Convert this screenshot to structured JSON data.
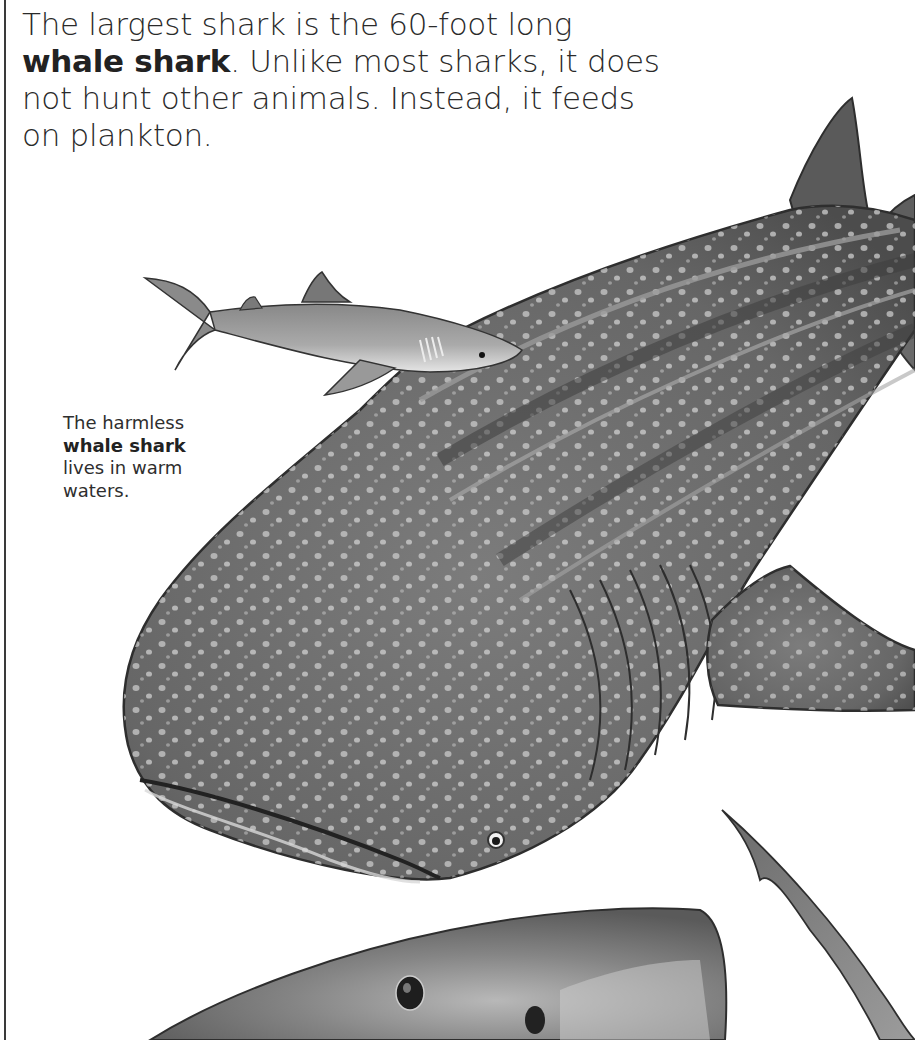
{
  "page": {
    "main_paragraph": {
      "line1": "The largest shark is the 60-foot long",
      "bold_term": "whale shark",
      "line2_rest": ". Unlike most sharks, it does",
      "line3": "not hunt other animals. Instead, it feeds",
      "line4": "on plankton."
    },
    "caption": {
      "line1": "The harmless",
      "bold_term": "whale shark",
      "line3": "lives in warm",
      "line4": "waters."
    },
    "illustration": {
      "subjects": [
        "small-shark",
        "whale-shark",
        "great-white-shark-head",
        "shark-fin"
      ],
      "colors": {
        "whale_shark_body": "#6e6e6e",
        "whale_shark_dark": "#4a4a4a",
        "spots": "#d8d8d8",
        "small_shark": "#9a9a9a",
        "great_white": "#7d7d7d",
        "border": "#3a3a3a",
        "text": "#2a2a2a"
      }
    }
  }
}
